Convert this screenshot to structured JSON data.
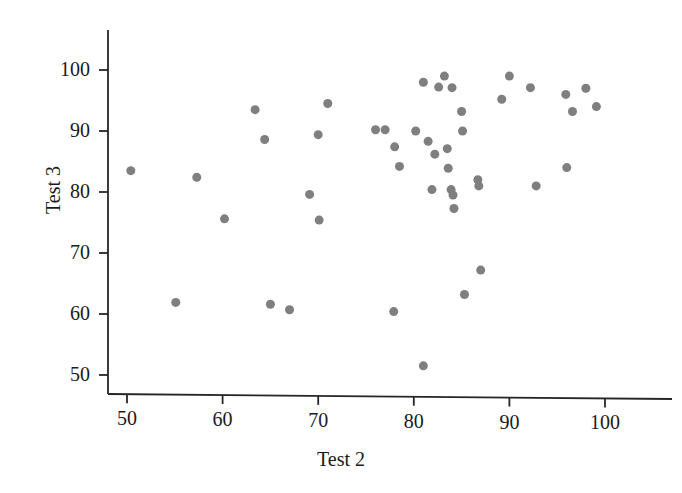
{
  "chart_data": {
    "type": "scatter",
    "title": "",
    "xlabel": "Test 2",
    "ylabel": "Test 3",
    "xlim": [
      46,
      103
    ],
    "ylim": [
      47.5,
      104
    ],
    "grid": false,
    "legend": null,
    "marker": {
      "shape": "circle",
      "color": "#7f7f7f",
      "size_px": 9
    },
    "axis_color": "#262626",
    "xticks": [
      50,
      60,
      70,
      80,
      90,
      100
    ],
    "yticks": [
      50,
      60,
      70,
      80,
      90,
      100
    ],
    "xtick_labels": [
      "50",
      "60",
      "70",
      "80",
      "90",
      "100"
    ],
    "ytick_labels": [
      "50",
      "60",
      "70",
      "80",
      "90",
      "100"
    ],
    "n_points": 47,
    "points": [
      {
        "x": 50.4,
        "y": 83.5
      },
      {
        "x": 55.1,
        "y": 61.9
      },
      {
        "x": 57.3,
        "y": 82.4
      },
      {
        "x": 60.2,
        "y": 75.6
      },
      {
        "x": 63.4,
        "y": 93.5
      },
      {
        "x": 64.4,
        "y": 88.6
      },
      {
        "x": 65.0,
        "y": 61.6
      },
      {
        "x": 67.0,
        "y": 60.7
      },
      {
        "x": 69.1,
        "y": 79.6
      },
      {
        "x": 70.0,
        "y": 89.4
      },
      {
        "x": 70.1,
        "y": 75.4
      },
      {
        "x": 71.0,
        "y": 94.5
      },
      {
        "x": 76.0,
        "y": 90.2
      },
      {
        "x": 77.0,
        "y": 90.2
      },
      {
        "x": 77.9,
        "y": 60.4
      },
      {
        "x": 78.0,
        "y": 87.4
      },
      {
        "x": 78.5,
        "y": 84.2
      },
      {
        "x": 80.2,
        "y": 90.0
      },
      {
        "x": 81.0,
        "y": 98.0
      },
      {
        "x": 81.0,
        "y": 51.5
      },
      {
        "x": 81.5,
        "y": 88.3
      },
      {
        "x": 81.9,
        "y": 80.4
      },
      {
        "x": 82.2,
        "y": 86.2
      },
      {
        "x": 82.6,
        "y": 97.2
      },
      {
        "x": 83.2,
        "y": 99.0
      },
      {
        "x": 83.5,
        "y": 87.1
      },
      {
        "x": 83.6,
        "y": 83.9
      },
      {
        "x": 83.9,
        "y": 80.4
      },
      {
        "x": 84.0,
        "y": 97.1
      },
      {
        "x": 84.1,
        "y": 79.5
      },
      {
        "x": 84.2,
        "y": 77.3
      },
      {
        "x": 85.0,
        "y": 93.2
      },
      {
        "x": 85.1,
        "y": 90.0
      },
      {
        "x": 85.3,
        "y": 63.2
      },
      {
        "x": 86.7,
        "y": 82.0
      },
      {
        "x": 86.8,
        "y": 81.0
      },
      {
        "x": 87.0,
        "y": 67.2
      },
      {
        "x": 89.2,
        "y": 95.2
      },
      {
        "x": 90.0,
        "y": 99.0
      },
      {
        "x": 92.2,
        "y": 97.1
      },
      {
        "x": 92.8,
        "y": 81.0
      },
      {
        "x": 95.9,
        "y": 96.0
      },
      {
        "x": 96.0,
        "y": 84.0
      },
      {
        "x": 96.6,
        "y": 93.2
      },
      {
        "x": 98.0,
        "y": 97.0
      },
      {
        "x": 99.1,
        "y": 94.0
      }
    ]
  },
  "axes": {
    "x_title": "Test 2",
    "y_title": "Test 3"
  }
}
